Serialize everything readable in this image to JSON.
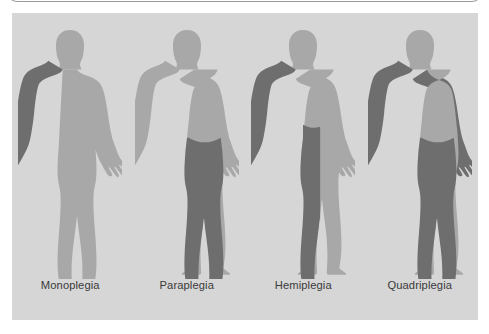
{
  "panel": {
    "background_color": "#d6d6d6",
    "body_color": "#a8a8a8",
    "affected_color": "#6e6e6e",
    "label_color": "#3a3a3a"
  },
  "figures": [
    {
      "id": "monoplegia",
      "label": "Monoplegia",
      "affected_regions": [
        "right-arm"
      ],
      "description": "One limb affected"
    },
    {
      "id": "paraplegia",
      "label": "Paraplegia",
      "affected_regions": [
        "left-leg",
        "right-leg",
        "hips"
      ],
      "description": "Both legs affected"
    },
    {
      "id": "hemiplegia",
      "label": "Hemiplegia",
      "affected_regions": [
        "right-arm",
        "right-leg"
      ],
      "description": "One side of the body affected"
    },
    {
      "id": "quadriplegia",
      "label": "Quadriplegia",
      "affected_regions": [
        "left-arm",
        "right-arm",
        "left-leg",
        "right-leg",
        "hips"
      ],
      "description": "All four limbs affected"
    }
  ]
}
